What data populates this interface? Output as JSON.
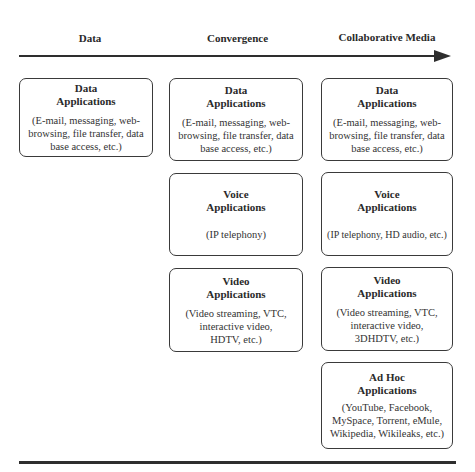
{
  "headers": [
    {
      "label": "Data"
    },
    {
      "label": "Convergence"
    },
    {
      "label": "Collaborative Media"
    }
  ],
  "columns": [
    {
      "boxes": [
        {
          "title_line1": "Data",
          "title_line2": "Applications",
          "desc": [
            "(E-mail, messaging, web-",
            "browsing, file transfer, data",
            "base access, etc.)"
          ]
        }
      ]
    },
    {
      "boxes": [
        {
          "title_line1": "Data",
          "title_line2": "Applications",
          "desc": [
            "(E-mail, messaging, web-",
            "browsing, file transfer, data",
            "base access, etc.)"
          ]
        },
        {
          "title_line1": "Voice",
          "title_line2": "Applications",
          "desc": [
            "(IP telephony)"
          ]
        },
        {
          "title_line1": "Video",
          "title_line2": "Applications",
          "desc": [
            "(Video streaming, VTC,",
            "interactive video,",
            "HDTV, etc.)"
          ]
        }
      ]
    },
    {
      "boxes": [
        {
          "title_line1": "Data",
          "title_line2": "Applications",
          "desc": [
            "(E-mail, messaging, web-",
            "browsing, file transfer, data",
            "base access, etc.)"
          ]
        },
        {
          "title_line1": "Voice",
          "title_line2": "Applications",
          "desc": [
            "(IP telephony, HD audio, etc.)"
          ]
        },
        {
          "title_line1": "Video",
          "title_line2": "Applications",
          "desc": [
            "(Video streaming, VTC,",
            "interactive video,",
            "3DHDTV, etc.)"
          ]
        },
        {
          "title_line1": "Ad Hoc",
          "title_line2": "Applications",
          "desc": [
            "(YouTube, Facebook,",
            "MySpace, Torrent, eMule,",
            "Wikipedia, Wikileaks, etc.)"
          ]
        }
      ]
    }
  ],
  "colors": {
    "line": "#2e2e2e",
    "border": "#3a3a3a",
    "text": "#2a2a2a"
  }
}
